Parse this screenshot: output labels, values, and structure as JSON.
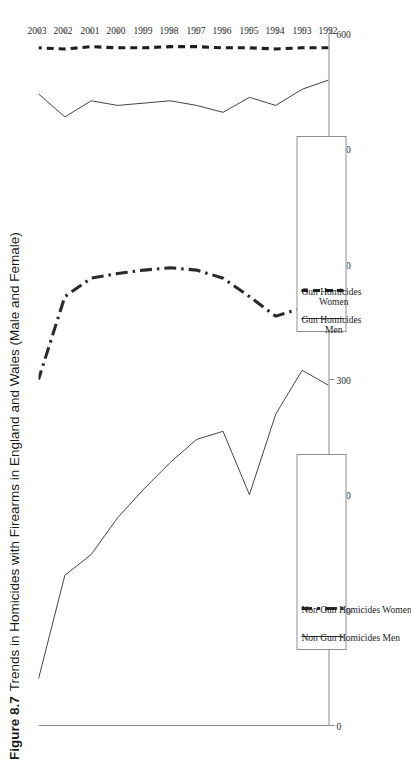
{
  "caption": {
    "figure_number": "Figure 8.7",
    "text": "Trends in Homicides with Firearms in England and Wales (Male and Female)"
  },
  "axes": {
    "y_ticks": [
      "600",
      "500",
      "400",
      "300",
      "200",
      "100",
      "0"
    ],
    "x_ticks": [
      "1992",
      "1993",
      "1994",
      "1995",
      "1996",
      "1997",
      "1998",
      "1999",
      "2000",
      "2001",
      "2002",
      "2003"
    ]
  },
  "legend_boxes": [
    {
      "id": "legend-gun",
      "entries": [
        {
          "label": "Gun Homicides\n  Men",
          "style": "solid"
        },
        {
          "label": "Gun Homicides\n  Women",
          "style": "dashed"
        }
      ]
    },
    {
      "id": "legend-nongun",
      "entries": [
        {
          "label": "Non Gun Homicides Men",
          "style": "solid"
        },
        {
          "label": "Non Gun Homicides Women",
          "style": "dashdot"
        }
      ]
    }
  ],
  "chart_data": {
    "type": "line",
    "title": "Trends in Homicides with Firearms in England and Wales (Male and Female)",
    "xlabel": "",
    "ylabel": "",
    "x": [
      1992,
      1993,
      1994,
      1995,
      1996,
      1997,
      1998,
      1999,
      2000,
      2001,
      2002,
      2003
    ],
    "xlim": [
      1992,
      2003
    ],
    "ylim": [
      0,
      600
    ],
    "ytick_values": [
      0,
      100,
      200,
      300,
      400,
      500,
      600
    ],
    "grid": false,
    "legend_position": "inside-lower-right",
    "orientation": "rotated-90-ccw",
    "series": [
      {
        "name": "Non Gun Homicides Men",
        "style": "solid",
        "color": "#3a3a3a",
        "values": [
          305,
          292,
          330,
          400,
          345,
          352,
          372,
          395,
          420,
          452,
          470,
          560
        ]
      },
      {
        "name": "Non Gun Homicides Women",
        "style": "dashdot",
        "color": "#2b2b2b",
        "values": [
          225,
          238,
          245,
          228,
          212,
          205,
          203,
          205,
          208,
          212,
          228,
          300
        ]
      },
      {
        "name": "Gun Homicides Men",
        "style": "solid",
        "color": "#3a3a3a",
        "values": [
          40,
          48,
          62,
          55,
          68,
          62,
          58,
          60,
          62,
          58,
          72,
          52
        ]
      },
      {
        "name": "Gun Homicides Women",
        "style": "dashed",
        "color": "#1f1f1f",
        "values": [
          12,
          12,
          13,
          12,
          12,
          11,
          11,
          12,
          12,
          11,
          13,
          12
        ]
      }
    ]
  }
}
